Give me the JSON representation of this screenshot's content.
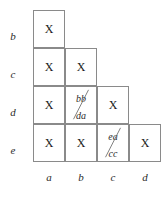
{
  "diagram": {
    "type": "staircase-tableau",
    "row_labels": [
      "b",
      "c",
      "d",
      "e"
    ],
    "col_labels": [
      "a",
      "b",
      "c",
      "d"
    ],
    "mark_symbol": "X",
    "colors": {
      "background": "#ffffff",
      "grid_line": "#8a8a8a",
      "text": "#1a1a1a",
      "label_text": "#2b2b2b"
    },
    "rows": [
      {
        "label": "b",
        "cells": [
          {
            "column": "a",
            "content": "X",
            "kind": "mark"
          }
        ]
      },
      {
        "label": "c",
        "cells": [
          {
            "column": "a",
            "content": "X",
            "kind": "mark"
          },
          {
            "column": "b",
            "content": "X",
            "kind": "mark"
          }
        ]
      },
      {
        "label": "d",
        "cells": [
          {
            "column": "a",
            "content": "X",
            "kind": "mark"
          },
          {
            "column": "b",
            "kind": "fraction",
            "numerator": "bb",
            "denominator": "da",
            "cancelled": true
          },
          {
            "column": "c",
            "content": "X",
            "kind": "mark"
          }
        ]
      },
      {
        "label": "e",
        "cells": [
          {
            "column": "a",
            "content": "X",
            "kind": "mark"
          },
          {
            "column": "b",
            "content": "X",
            "kind": "mark"
          },
          {
            "column": "c",
            "kind": "fraction",
            "numerator": "ea",
            "denominator": "cc",
            "cancelled": true
          },
          {
            "column": "d",
            "content": "X",
            "kind": "mark"
          }
        ]
      }
    ]
  }
}
